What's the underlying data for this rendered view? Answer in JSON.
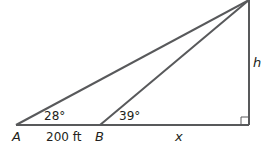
{
  "diagram": {
    "type": "right-triangle-angles-of-elevation",
    "points": {
      "A": {
        "label": "A"
      },
      "B": {
        "label": "B"
      }
    },
    "angles": {
      "at_A": "28°",
      "at_B": "39°"
    },
    "lengths": {
      "AB": "200 ft",
      "base_remaining": "x",
      "height": "h"
    },
    "colors": {
      "line": "#58595b",
      "text": "#231f20"
    }
  }
}
